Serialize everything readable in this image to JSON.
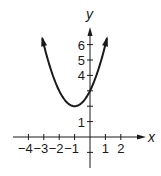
{
  "chart_data": {
    "type": "line",
    "title": "",
    "xlabel": "x",
    "ylabel": "y",
    "function": "y = (x + 1)^2 + 2",
    "vertex": [
      -1,
      2
    ],
    "y_intercept": 3,
    "x_ticks": [
      -4,
      -3,
      -2,
      -1,
      1,
      2
    ],
    "x_tick_labels": [
      "−4",
      "−3",
      "−2",
      "−1",
      "1",
      "2"
    ],
    "y_ticks": [
      -1,
      1,
      2,
      3,
      4,
      5,
      6
    ],
    "y_tick_labels": [
      "1",
      "4",
      "5",
      "6"
    ],
    "xlim": [
      -5,
      3.5
    ],
    "ylim": [
      -2,
      7
    ],
    "grid": false,
    "legend": null,
    "series": [
      {
        "name": "parabola",
        "x": [
          -3.1,
          -3,
          -2.5,
          -2,
          -1.5,
          -1,
          -0.5,
          0,
          0.5,
          1,
          1.1
        ],
        "y": [
          6.41,
          6,
          4.25,
          3,
          2.25,
          2,
          2.25,
          3,
          4.25,
          6,
          6.41
        ],
        "arrows_at_ends": true
      }
    ]
  }
}
